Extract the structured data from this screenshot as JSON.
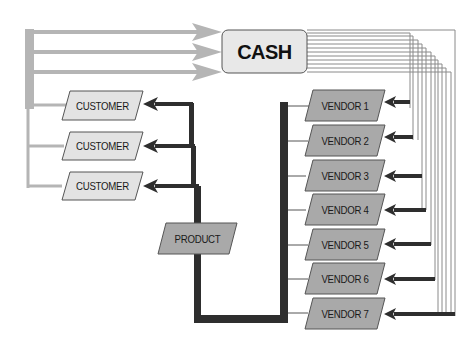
{
  "diagram": {
    "type": "cash-flow",
    "cash": {
      "label": "CASH"
    },
    "product": {
      "label": "PRODUCT"
    },
    "customers": [
      {
        "label": "CUSTOMER"
      },
      {
        "label": "CUSTOMER"
      },
      {
        "label": "CUSTOMER"
      }
    ],
    "vendors": [
      {
        "label": "VENDOR 1"
      },
      {
        "label": "VENDOR 2"
      },
      {
        "label": "VENDOR 3"
      },
      {
        "label": "VENDOR 4"
      },
      {
        "label": "VENDOR 5"
      },
      {
        "label": "VENDOR 6"
      },
      {
        "label": "VENDOR 7"
      }
    ],
    "colors": {
      "cash_flow_from_customers": "#b5b5b5",
      "product_flow": "#2e2e2e",
      "cash_to_vendors": "#8a8a8a",
      "customer_fill": "#e3e3e3",
      "vendor_fill": "#a9a9a9",
      "product_fill": "#a9a9a9",
      "cash_fill": "#e8e8e8"
    }
  }
}
